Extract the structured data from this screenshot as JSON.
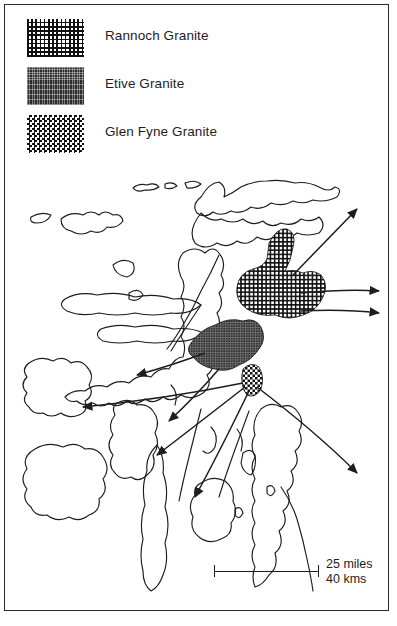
{
  "figure": {
    "kind": "geological-map",
    "region": "Western Scotland",
    "frame_color": "#2b2b2b",
    "background": "#ffffff"
  },
  "legend": {
    "items": [
      {
        "label": "Rannoch Granite",
        "pattern": "fine-grid-hatch",
        "swatch_name": "legend-swatch-rannoch"
      },
      {
        "label": "Etive Granite",
        "pattern": "dense-dark-stipple",
        "swatch_name": "legend-swatch-etive"
      },
      {
        "label": "Glen Fyne Granite",
        "pattern": "checkerboard",
        "swatch_name": "legend-swatch-glen-fyne"
      }
    ]
  },
  "map": {
    "granite_bodies": [
      {
        "name": "Rannoch Granite",
        "pattern": "fine-grid-hatch",
        "position": "east-central"
      },
      {
        "name": "Etive Granite",
        "pattern": "dense-dark-stipple",
        "position": "central"
      },
      {
        "name": "Glen Fyne Granite",
        "pattern": "checkerboard",
        "position": "south-central"
      }
    ],
    "arrow_groups": [
      {
        "origin": "Rannoch Granite",
        "count": 3,
        "directions": [
          "northeast",
          "east",
          "east-southeast"
        ]
      },
      {
        "origin": "Etive Granite",
        "count": 2,
        "directions": [
          "west",
          "south-southwest"
        ]
      },
      {
        "origin": "Glen Fyne Granite",
        "count": 4,
        "directions": [
          "west",
          "southwest",
          "south",
          "southeast"
        ]
      }
    ],
    "coastline_style": "outline-only"
  },
  "scale_bar": {
    "miles_label": "25 miles",
    "kms_label": "40 kms"
  },
  "colors": {
    "ink": "#1d1d1d",
    "etive_fill": "#2c2c2c",
    "frame": "#2b2b2b"
  }
}
